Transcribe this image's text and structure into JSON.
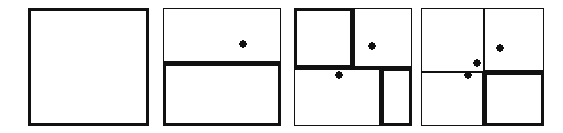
{
  "figure": {
    "type": "diagram",
    "name": "recursive-space-subdivision-sequence",
    "title": "",
    "canvas": {
      "width": 563,
      "height": 133,
      "background": "#ffffff"
    },
    "ink_color": "#111111",
    "thin_stroke": 1.2,
    "thick_stroke": 3.2,
    "point_radius": 3.6,
    "point_color": "#111111"
  },
  "panels": [
    {
      "id": "panel-1",
      "label": "step-1-empty-root-cell",
      "box": {
        "x": 28,
        "y": 8,
        "width": 121,
        "height": 118
      },
      "frame_weight": "thick",
      "dividers": [],
      "cells": [
        {
          "name": "root-cell",
          "x": 28,
          "y": 8,
          "width": 121,
          "height": 118,
          "outline": "thick"
        }
      ],
      "points": []
    },
    {
      "id": "panel-2",
      "label": "step-2-first-horizontal-split",
      "box": {
        "x": 163,
        "y": 8,
        "width": 118,
        "height": 118
      },
      "frame_weight": "thin",
      "dividers": [
        {
          "orientation": "horizontal",
          "position": 63,
          "from": 163,
          "to": 281,
          "weight": "thick"
        }
      ],
      "cells": [
        {
          "name": "top-cell",
          "x": 163,
          "y": 8,
          "width": 118,
          "height": 55,
          "outline": "thin"
        },
        {
          "name": "bottom-cell-active",
          "x": 163,
          "y": 63,
          "width": 118,
          "height": 63,
          "outline": "thick"
        }
      ],
      "points": [
        {
          "name": "point-a",
          "x": 243,
          "y": 44
        }
      ]
    },
    {
      "id": "panel-3",
      "label": "step-3-vertical-split-of-both-halves",
      "box": {
        "x": 294,
        "y": 8,
        "width": 118,
        "height": 118
      },
      "frame_weight": "thin",
      "dividers": [
        {
          "orientation": "horizontal",
          "position": 68,
          "from": 294,
          "to": 412,
          "weight": "thick"
        },
        {
          "orientation": "vertical",
          "position": 353,
          "from": 8,
          "to": 68,
          "weight": "thick"
        },
        {
          "orientation": "vertical",
          "position": 381,
          "from": 68,
          "to": 126,
          "weight": "thick"
        }
      ],
      "cells": [
        {
          "name": "top-left-cell-active",
          "x": 294,
          "y": 8,
          "width": 59,
          "height": 60,
          "outline": "thick"
        },
        {
          "name": "top-right-cell",
          "x": 353,
          "y": 8,
          "width": 59,
          "height": 60,
          "outline": "thin"
        },
        {
          "name": "bottom-left-cell",
          "x": 294,
          "y": 68,
          "width": 87,
          "height": 58,
          "outline": "thin"
        },
        {
          "name": "bottom-right-cell-active",
          "x": 381,
          "y": 68,
          "width": 31,
          "height": 58,
          "outline": "thick"
        }
      ],
      "points": [
        {
          "name": "point-a",
          "x": 372,
          "y": 46
        },
        {
          "name": "point-b",
          "x": 339,
          "y": 75
        }
      ]
    },
    {
      "id": "panel-4",
      "label": "step-4-third-point-inserted",
      "box": {
        "x": 421,
        "y": 8,
        "width": 123,
        "height": 118
      },
      "frame_weight": "thin",
      "dividers": [
        {
          "orientation": "horizontal",
          "position": 72,
          "from": 421,
          "to": 484,
          "weight": "thin"
        },
        {
          "orientation": "horizontal",
          "position": 72,
          "from": 484,
          "to": 544,
          "weight": "thick"
        },
        {
          "orientation": "vertical",
          "position": 484,
          "from": 8,
          "to": 72,
          "weight": "thin"
        },
        {
          "orientation": "vertical",
          "position": 484,
          "from": 72,
          "to": 126,
          "weight": "thick"
        }
      ],
      "cells": [
        {
          "name": "top-left-cell",
          "x": 421,
          "y": 8,
          "width": 63,
          "height": 64,
          "outline": "thin"
        },
        {
          "name": "top-right-cell",
          "x": 484,
          "y": 8,
          "width": 60,
          "height": 64,
          "outline": "thin"
        },
        {
          "name": "bottom-left-cell",
          "x": 421,
          "y": 72,
          "width": 63,
          "height": 54,
          "outline": "thin"
        },
        {
          "name": "bottom-right-cell-active",
          "x": 484,
          "y": 72,
          "width": 60,
          "height": 54,
          "outline": "thick"
        }
      ],
      "points": [
        {
          "name": "point-a",
          "x": 500,
          "y": 48
        },
        {
          "name": "point-c",
          "x": 477,
          "y": 63
        },
        {
          "name": "point-b",
          "x": 468,
          "y": 75
        }
      ]
    }
  ]
}
